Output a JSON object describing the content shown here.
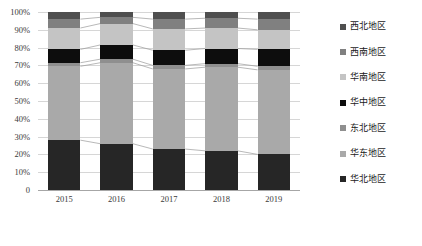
{
  "chart_data": {
    "type": "bar",
    "subtype": "100-percent-stacked",
    "title": "",
    "xlabel": "",
    "ylabel": "",
    "categories": [
      "2015",
      "2016",
      "2017",
      "2018",
      "2019"
    ],
    "ylim": [
      0,
      100
    ],
    "ytick_labels": [
      "0",
      "10%",
      "20%",
      "30%",
      "40%",
      "50%",
      "60%",
      "70%",
      "80%",
      "90%",
      "100%"
    ],
    "ytick_values": [
      0,
      10,
      20,
      30,
      40,
      50,
      60,
      70,
      80,
      90,
      100
    ],
    "grid": true,
    "legend_position": "right",
    "stack_order_bottom_to_top": [
      "华北地区",
      "华东地区",
      "东北地区",
      "华中地区",
      "华南地区",
      "西南地区",
      "西北地区"
    ],
    "series": [
      {
        "name": "西北地区",
        "color": "#4f4f4f",
        "values": [
          4.0,
          3.0,
          4.0,
          3.5,
          4.0
        ]
      },
      {
        "name": "西南地区",
        "color": "#808080",
        "values": [
          5.0,
          3.5,
          5.5,
          5.5,
          6.0
        ]
      },
      {
        "name": "华南地区",
        "color": "#c4c4c4",
        "values": [
          12.0,
          12.0,
          12.0,
          11.5,
          11.0
        ]
      },
      {
        "name": "华中地区",
        "color": "#0d0d0d",
        "values": [
          7.5,
          8.0,
          8.5,
          8.5,
          9.5
        ]
      },
      {
        "name": "东北地区",
        "color": "#8f8f8f",
        "values": [
          2.0,
          2.0,
          2.0,
          2.0,
          2.0
        ]
      },
      {
        "name": "华东地区",
        "color": "#a9a9a9",
        "values": [
          41.5,
          45.5,
          45.0,
          47.0,
          47.5
        ]
      },
      {
        "name": "华北地区",
        "color": "#262626",
        "values": [
          28.0,
          26.0,
          23.0,
          22.0,
          20.0
        ]
      }
    ]
  },
  "legend": {
    "items": [
      {
        "label": "西北地区",
        "color": "#4f4f4f"
      },
      {
        "label": "西南地区",
        "color": "#808080"
      },
      {
        "label": "华南地区",
        "color": "#c4c4c4"
      },
      {
        "label": "华中地区",
        "color": "#0d0d0d"
      },
      {
        "label": "东北地区",
        "color": "#8f8f8f"
      },
      {
        "label": "华东地区",
        "color": "#a9a9a9"
      },
      {
        "label": "华北地区",
        "color": "#262626"
      }
    ]
  }
}
